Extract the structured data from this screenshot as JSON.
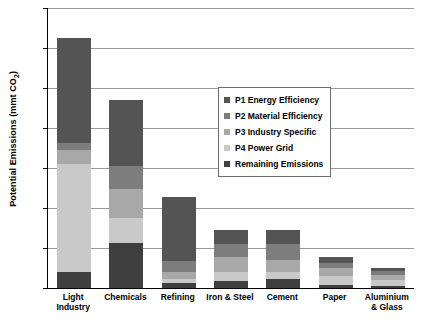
{
  "chart_data": {
    "type": "bar",
    "title": "",
    "xlabel": "",
    "ylabel": "Potential Emissions (mmt CO2)",
    "ylabel_html": "Potential Emissions (mmt CO<sub>2</sub>)",
    "ylim": [
      0,
      700
    ],
    "yticks": [
      0,
      100,
      200,
      300,
      400,
      500,
      600,
      700
    ],
    "ytick_labels": [
      "0",
      "100",
      "200",
      "300",
      "400",
      "500",
      "600",
      "700"
    ],
    "grid": true,
    "stacked": true,
    "legend_position": "inside-upper-right",
    "categories": [
      "Light Industry",
      "Chemicals",
      "Refining",
      "Iron & Steel",
      "Cement",
      "Paper",
      "Aluminium & Glass"
    ],
    "series": [
      {
        "name": "Remaining Emissions",
        "color": "#3f3f3f",
        "values": [
          40,
          113,
          12,
          18,
          22,
          8,
          6
        ]
      },
      {
        "name": "P4 Power Grid",
        "color": "#c9c9c9",
        "values": [
          270,
          62,
          10,
          22,
          18,
          22,
          14
        ]
      },
      {
        "name": "P3 Industry Specific",
        "color": "#a8a8a8",
        "values": [
          35,
          72,
          18,
          38,
          30,
          20,
          12
        ]
      },
      {
        "name": "P2 Material Efficiency",
        "color": "#7d7d7d",
        "values": [
          18,
          58,
          28,
          32,
          40,
          12,
          10
        ]
      },
      {
        "name": "P1 Energy Efficiency",
        "color": "#545454",
        "values": [
          262,
          165,
          160,
          35,
          35,
          16,
          8
        ]
      }
    ],
    "totals": [
      625,
      470,
      228,
      145,
      145,
      78,
      50
    ],
    "annotations": []
  },
  "legend": {
    "items": [
      {
        "label": "P1 Energy Efficiency",
        "color": "#545454"
      },
      {
        "label": "P2 Material Efficiency",
        "color": "#7d7d7d"
      },
      {
        "label": "P3 Industry Specific",
        "color": "#a8a8a8"
      },
      {
        "label": "P4 Power Grid",
        "color": "#c9c9c9"
      },
      {
        "label": "Remaining Emissions",
        "color": "#3f3f3f"
      }
    ]
  },
  "axes": {
    "y_title_main": "Potential Emissions (mmt CO",
    "y_title_sub": "2",
    "y_title_end": ")"
  }
}
